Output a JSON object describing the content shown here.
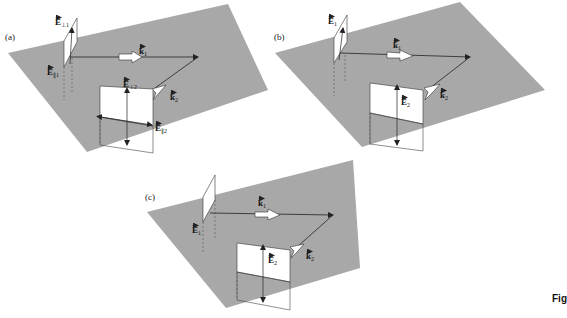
{
  "figure": {
    "caption_fragment": "Fig",
    "colors": {
      "plane": "#a8a8a8",
      "sheet": "#ffffff",
      "line": "#222222",
      "background": "#ffffff"
    }
  },
  "panels": [
    {
      "id": "a",
      "label": "(a)",
      "vectors": {
        "E_perp1": {
          "base": "E",
          "sub": "⊥1"
        },
        "E_par1": {
          "base": "E",
          "sub": "∥1"
        },
        "k1": {
          "base": "k",
          "sub": "1"
        },
        "k2": {
          "base": "k",
          "sub": "2"
        },
        "E_perp2": {
          "base": "E",
          "sub": "⊥2"
        },
        "E_par2": {
          "base": "E",
          "sub": "∥2"
        }
      }
    },
    {
      "id": "b",
      "label": "(b)",
      "vectors": {
        "E1": {
          "base": "E",
          "sub": "1"
        },
        "k1": {
          "base": "k",
          "sub": "1"
        },
        "k2": {
          "base": "k",
          "sub": "2"
        },
        "E2": {
          "base": "E",
          "sub": "2"
        }
      }
    },
    {
      "id": "c",
      "label": "(c)",
      "vectors": {
        "E1": {
          "base": "E",
          "sub": "1"
        },
        "k1": {
          "base": "k",
          "sub": "1"
        },
        "k2": {
          "base": "k",
          "sub": "2"
        },
        "E2": {
          "base": "E",
          "sub": "2"
        }
      }
    }
  ]
}
